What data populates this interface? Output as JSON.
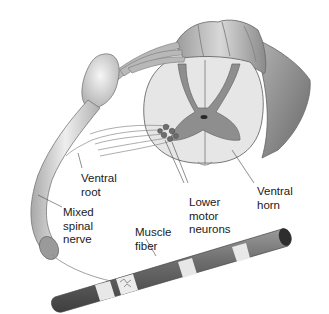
{
  "diagram": {
    "colors": {
      "white_matter": "#e4e4e4",
      "gray_matter": "#8c8c8c",
      "outer_surface": "#7a7a7a",
      "nerve": "#d0d0d0",
      "neuron_body": "#6e6e6e",
      "label_text": "#1a1a1a"
    },
    "labels": {
      "ventral_root": "Ventral\nroot",
      "mixed_spinal_nerve": "Mixed\nspinal\nnerve",
      "muscle_fiber": "Muscle\nfiber",
      "lower_motor_neurons": "Lower\nmotor\nneurons",
      "ventral_horn": "Ventral\nhorn"
    }
  }
}
